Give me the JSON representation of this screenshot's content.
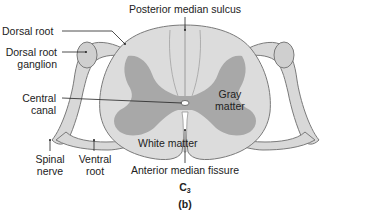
{
  "diagram": {
    "type": "anatomical-cross-section",
    "level": {
      "main": "C",
      "sub": "3"
    },
    "panel_label": "(b)",
    "labels": {
      "posterior_median_sulcus": "Posterior median sulcus",
      "dorsal_root": "Dorsal root",
      "dorsal_root_ganglion_1": "Dorsal root",
      "dorsal_root_ganglion_2": "ganglion",
      "central_canal_1": "Central",
      "central_canal_2": "canal",
      "gray_matter_1": "Gray",
      "gray_matter_2": "matter",
      "white_matter": "White matter",
      "spinal_nerve_1": "Spinal",
      "spinal_nerve_2": "nerve",
      "ventral_root_1": "Ventral",
      "ventral_root_2": "root",
      "anterior_median_fissure": "Anterior median fissure"
    },
    "colors": {
      "white_matter": "#dcdcdc",
      "gray_matter": "#a8a8a8",
      "nerve": "#d6d6d6",
      "outline": "#7a7a7a",
      "leader": "#222222",
      "background": "#ffffff"
    }
  }
}
